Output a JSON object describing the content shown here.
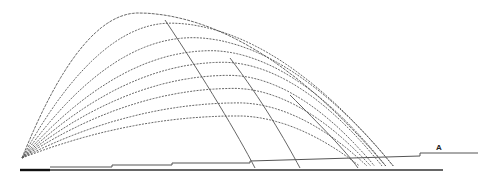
{
  "diagram": {
    "title": "",
    "label": "A",
    "colors": {
      "trajectory": "#555555",
      "ground": "#333333",
      "ground_dark": "#111111",
      "label": "#222222"
    },
    "trajectories": [
      {
        "name": "trajectory-1",
        "apex_height": 1.0,
        "range": 0.97,
        "apex_position": 0.32
      },
      {
        "name": "trajectory-2",
        "apex_height": 0.93,
        "range": 0.99,
        "apex_position": 0.4
      },
      {
        "name": "trajectory-3",
        "apex_height": 0.83,
        "range": 0.99,
        "apex_position": 0.46
      },
      {
        "name": "trajectory-4",
        "apex_height": 0.74,
        "range": 0.97,
        "apex_position": 0.52
      },
      {
        "name": "trajectory-5",
        "apex_height": 0.66,
        "range": 0.96,
        "apex_position": 0.56
      },
      {
        "name": "trajectory-6",
        "apex_height": 0.57,
        "range": 0.94,
        "apex_position": 0.59
      },
      {
        "name": "trajectory-7",
        "apex_height": 0.48,
        "range": 0.93,
        "apex_position": 0.61
      },
      {
        "name": "trajectory-8",
        "apex_height": 0.38,
        "range": 0.92,
        "apex_position": 0.63
      },
      {
        "name": "trajectory-9",
        "apex_height": 0.29,
        "range": 0.9,
        "apex_position": 0.64
      }
    ],
    "descending_lines": [
      {
        "name": "descent-line-1"
      },
      {
        "name": "descent-line-2"
      },
      {
        "name": "descent-line-3"
      }
    ]
  }
}
